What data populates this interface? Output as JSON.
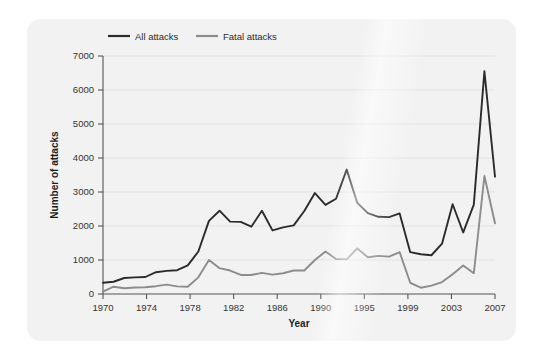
{
  "chart_data": {
    "type": "line",
    "title": "",
    "xlabel": "Year",
    "ylabel": "Number of attacks",
    "ylim": [
      0,
      7000
    ],
    "ytick_values": [
      0,
      1000,
      2000,
      3000,
      4000,
      5000,
      6000,
      7000
    ],
    "ytick_labels": [
      "0",
      "1000",
      "2000",
      "3000",
      "4000",
      "5000",
      "6000",
      "7000"
    ],
    "xtick_labels": [
      "1970",
      "1974",
      "1978",
      "1982",
      "1986",
      "1990",
      "1995",
      "1999",
      "2003",
      "2007"
    ],
    "x": [
      1970,
      1971,
      1972,
      1973,
      1974,
      1975,
      1976,
      1977,
      1978,
      1979,
      1980,
      1981,
      1982,
      1983,
      1984,
      1985,
      1986,
      1987,
      1988,
      1989,
      1990,
      1991,
      1992,
      1993,
      1994,
      1995,
      1996,
      1997,
      1998,
      1999,
      2000,
      2001,
      2002,
      2003,
      2004,
      2005,
      2006,
      2007
    ],
    "grid": true,
    "grid_axis": "y",
    "legend_position": "top-left",
    "series": [
      {
        "name": "All attacks",
        "color": "#2b2b2b",
        "values": [
          330,
          360,
          470,
          490,
          500,
          640,
          680,
          700,
          840,
          1250,
          2150,
          2450,
          2130,
          2120,
          1980,
          2450,
          1870,
          1960,
          2020,
          2440,
          2970,
          2620,
          2800,
          3660,
          2680,
          2380,
          2270,
          2260,
          2370,
          1230,
          1170,
          1140,
          1480,
          2640,
          1810,
          2630,
          6550,
          3450
        ]
      },
      {
        "name": "Fatal attacks",
        "color": "#8c8c8c",
        "values": [
          70,
          215,
          170,
          190,
          200,
          230,
          275,
          225,
          215,
          490,
          1000,
          760,
          690,
          560,
          560,
          620,
          570,
          610,
          690,
          690,
          1000,
          1250,
          1030,
          1020,
          1340,
          1080,
          1120,
          1100,
          1230,
          330,
          185,
          245,
          350,
          580,
          840,
          610,
          3470,
          2080
        ]
      }
    ]
  },
  "legend": {
    "items": [
      {
        "label": "All attacks",
        "color": "#2b2b2b"
      },
      {
        "label": "Fatal attacks",
        "color": "#8c8c8c"
      }
    ]
  }
}
